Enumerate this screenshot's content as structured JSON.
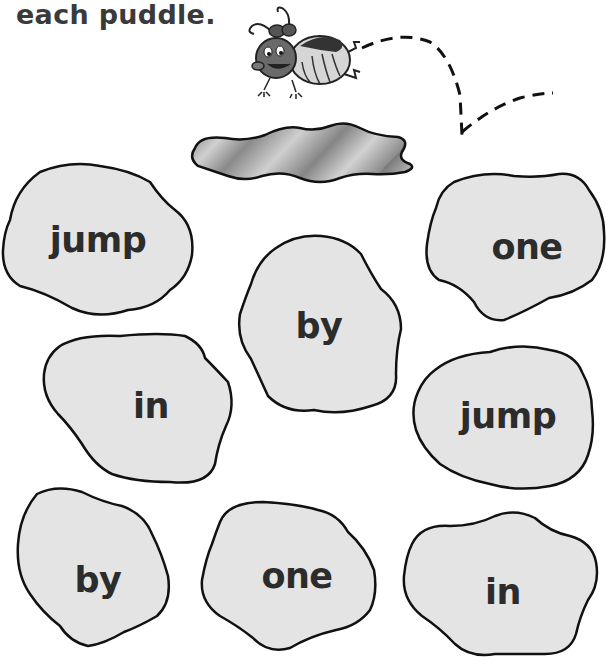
{
  "instruction": "each puddle.",
  "colors": {
    "puddle_fill": "#e4e4e4",
    "puddle_stroke": "#111111",
    "text": "#2c2c2c",
    "shaded_puddle": "#a9a9a9"
  },
  "illustration": {
    "character": "ladybug-icon",
    "path": "dashed-jump-path",
    "landing_puddle": "shaded-puddle"
  },
  "puddles": [
    {
      "word": "jump"
    },
    {
      "word": "one"
    },
    {
      "word": "by"
    },
    {
      "word": "in"
    },
    {
      "word": "jump"
    },
    {
      "word": "by"
    },
    {
      "word": "one"
    },
    {
      "word": "in"
    }
  ]
}
